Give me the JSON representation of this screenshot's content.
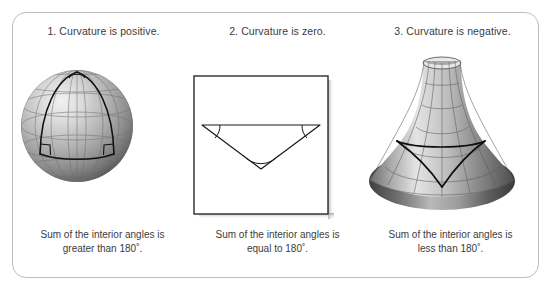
{
  "figure": {
    "border_color": "#bdbdbd",
    "background": "#ffffff",
    "text_color": "#3c3c3c"
  },
  "panels": [
    {
      "title": "1. Curvature is positive.",
      "caption": "Sum of the interior angles is greater than 180˚.",
      "caption_line1": "Sum of the interior angles is",
      "caption_line2": "greater than 180˚.",
      "surface": "sphere",
      "surface_name": "sphere-illustration",
      "angle_marks": "two-right-angle-squares-and-apex-arc"
    },
    {
      "title": "2. Curvature is zero.",
      "caption": "Sum of the interior angles is equal to 180˚.",
      "caption_line1": "Sum of the interior angles is",
      "caption_line2": "equal to 180˚.",
      "surface": "flat-plane",
      "surface_name": "flat-square-illustration",
      "angle_marks": "three-angle-arcs"
    },
    {
      "title": "3. Curvature is negative.",
      "caption": "Sum of the interior angles is less than 180˚.",
      "caption_line1": "Sum of the interior angles is",
      "caption_line2": "less than 180˚.",
      "surface": "pseudosphere-trumpet",
      "surface_name": "pseudosphere-illustration",
      "angle_marks": "concave-triangle-edges"
    }
  ],
  "colors": {
    "sphere_light": "#e2e2e2",
    "sphere_mid": "#9a9a9a",
    "sphere_dark": "#4a4a4a",
    "grid_line": "#6b6b6b",
    "triangle_line": "#111111",
    "plane_fill": "#ffffff",
    "plane_border": "#2a2a2a",
    "plane_shadow": "#b5b5b5",
    "trumpet_light": "#dcdcdc",
    "trumpet_mid": "#8d8d8d",
    "trumpet_dark": "#3a3a3a"
  }
}
